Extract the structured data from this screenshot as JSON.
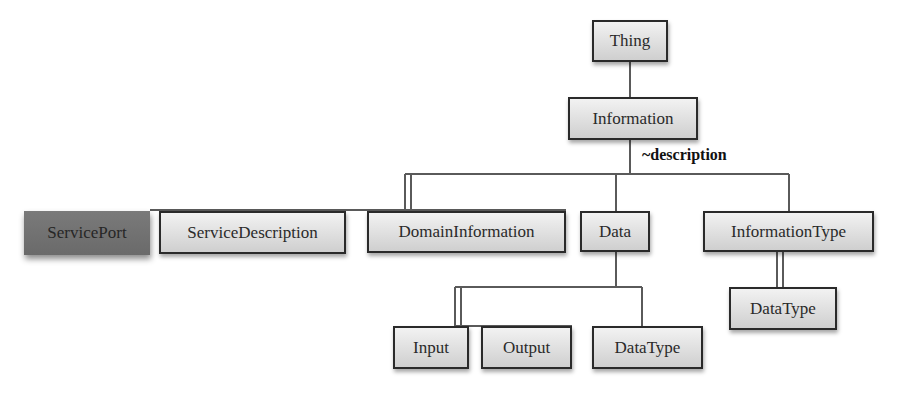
{
  "diagram": {
    "type": "class-hierarchy",
    "nodes": {
      "thing": "Thing",
      "information": "Information",
      "service_port": "ServicePort",
      "service_description": "ServiceDescription",
      "domain_information": "DomainInformation",
      "data": "Data",
      "information_type": "InformationType",
      "data_type_right": "DataType",
      "input": "Input",
      "output": "Output",
      "data_type_bottom": "DataType"
    },
    "edge_labels": {
      "description": "~description"
    },
    "edges": [
      {
        "from": "Thing",
        "to": "Information"
      },
      {
        "from": "Information",
        "to": "ServiceDescription"
      },
      {
        "from": "Information",
        "to": "DomainInformation"
      },
      {
        "from": "Information",
        "to": "Data"
      },
      {
        "from": "Information",
        "to": "InformationType"
      },
      {
        "from": "Data",
        "to": "Input"
      },
      {
        "from": "Data",
        "to": "Output"
      },
      {
        "from": "Data",
        "to": "DataType"
      },
      {
        "from": "InformationType",
        "to": "DataType"
      }
    ],
    "colors": {
      "node_fill": "#dcdcdc",
      "node_border": "#2a2a2a",
      "highlight_fill": "#727272",
      "wire": "#555555"
    }
  }
}
